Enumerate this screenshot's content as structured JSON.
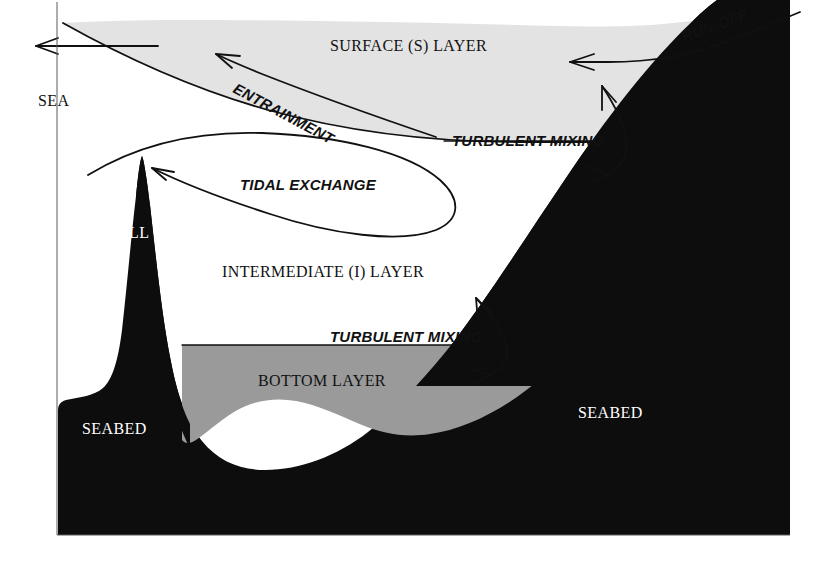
{
  "figure": {
    "type": "schematic-cross-section",
    "canvas": {
      "width": 832,
      "height": 573
    }
  },
  "colors": {
    "surface_layer_fill": "#e3e3e3",
    "bottom_layer_fill": "#9a9a9a",
    "seabed_fill": "#0d0d0d",
    "intermediate_layer_fill": "#ffffff",
    "background": "#ffffff",
    "line_stroke": "#111111",
    "dark_text": "#111111",
    "light_text": "#ffffff"
  },
  "labels": {
    "sea": "SEA",
    "surface_layer": "SURFACE (S) LAYER",
    "intermediate_layer": "INTERMEDIATE (I) LAYER",
    "bottom_layer": "BOTTOM LAYER",
    "sill": "SILL",
    "seabed_left": "SEABED",
    "seabed_right": "SEABED",
    "entrainment": "ENTRAINMENT",
    "tidal_exchange": "TIDAL EXCHANGE",
    "run_off": "RUN-OFF",
    "turbulent_mixing_upper": "TURBULENT MIXING",
    "turbulent_mixing_lower": "TURBULENT MIXING"
  },
  "layers": [
    {
      "name": "surface-layer",
      "label": "SURFACE (S) LAYER",
      "fill": "#e3e3e3",
      "position": "top-wedge"
    },
    {
      "name": "intermediate-layer",
      "label": "INTERMEDIATE (I) LAYER",
      "fill": "#ffffff",
      "position": "middle"
    },
    {
      "name": "bottom-layer",
      "label": "BOTTOM LAYER",
      "fill": "#9a9a9a",
      "position": "basin-floor"
    },
    {
      "name": "seabed",
      "label": "SEABED",
      "fill": "#0d0d0d",
      "position": "substrate"
    }
  ],
  "flows": [
    {
      "name": "outflow-arrow",
      "direction": "left",
      "layer": "surface"
    },
    {
      "name": "entrainment-arrow",
      "label": "ENTRAINMENT",
      "direction": "up-left",
      "rotation_deg": 28
    },
    {
      "name": "run-off-arrow",
      "label": "RUN-OFF",
      "direction": "left",
      "rotation_deg": -20
    },
    {
      "name": "tidal-exchange-loop",
      "label": "TIDAL EXCHANGE",
      "direction": "counter-clockwise-loop"
    },
    {
      "name": "turbulent-mixing-upper-arrow",
      "label": "TURBULENT MIXING",
      "direction": "bidirectional-vertical"
    },
    {
      "name": "turbulent-mixing-lower-arrow",
      "label": "TURBULENT MIXING",
      "direction": "bidirectional-vertical"
    }
  ],
  "label_rotations": {
    "entrainment_deg": 28,
    "run_off_deg": -20
  },
  "font_sizes": {
    "layer_label": 16,
    "flow_label": 15,
    "small_label": 15
  }
}
